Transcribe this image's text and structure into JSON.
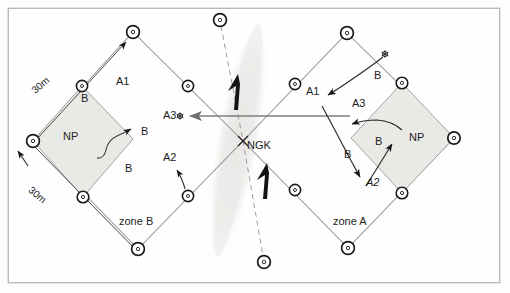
{
  "figure": {
    "center_label": "NGK",
    "zone_left_label": "zone B",
    "zone_right_label": "zone A",
    "np_left_label": "NP",
    "np_right_label": "NP",
    "dimension_upper": "30m",
    "dimension_lower": "30m"
  },
  "colors": {
    "node_ring": "#1a1a1a",
    "node_fill": "#ffffff",
    "edge": "#8d8d8d",
    "shade": "#e9e9e6",
    "band": "#eeeeec",
    "arrow_dark": "#161616",
    "arrow_gray": "#7e7e7e",
    "frame": "#b9b9b9",
    "text": "#1d1d1d",
    "background": "#fdfdfc"
  },
  "left_zone": {
    "name": "zone B",
    "routes": [
      {
        "id": "A1",
        "label": "A1",
        "x": 118,
        "y": 82
      },
      {
        "id": "A2",
        "label": "A2",
        "x": 170,
        "y": 158
      },
      {
        "id": "A3",
        "label": "A3",
        "x": 170,
        "y": 114
      }
    ],
    "ball_labels": [
      {
        "label": "B",
        "x": 85,
        "y": 98
      },
      {
        "label": "B",
        "x": 143,
        "y": 132
      },
      {
        "label": "B",
        "x": 127,
        "y": 168
      }
    ],
    "np_label": "NP",
    "zone_label": "zone B",
    "dim_top": "30m",
    "dim_bottom": "30m"
  },
  "right_zone": {
    "name": "zone A",
    "routes": [
      {
        "id": "A1",
        "label": "A1",
        "x": 310,
        "y": 92
      },
      {
        "id": "A2",
        "label": "A2",
        "x": 369,
        "y": 182
      },
      {
        "id": "A3",
        "label": "A3",
        "x": 356,
        "y": 104
      }
    ],
    "ball_labels": [
      {
        "label": "B",
        "x": 375,
        "y": 76
      },
      {
        "label": "B",
        "x": 398,
        "y": 141
      },
      {
        "label": "B",
        "x": 345,
        "y": 155
      }
    ],
    "np_label": "NP",
    "zone_label": "zone A"
  },
  "markers": {
    "center": "NGK",
    "asterisk_left": "A3-target-marker",
    "asterisk_right": "serve-marker"
  },
  "nodes": [
    {
      "name": "left-top-vertex",
      "x": 133,
      "y": 32
    },
    {
      "name": "left-upper-left-mid",
      "x": 82,
      "y": 86
    },
    {
      "name": "left-west-vertex",
      "x": 33,
      "y": 141
    },
    {
      "name": "left-lower-left-mid",
      "x": 83,
      "y": 197
    },
    {
      "name": "left-bottom-vertex",
      "x": 138,
      "y": 249
    },
    {
      "name": "left-lower-right-mid",
      "x": 188,
      "y": 196
    },
    {
      "name": "left-upper-right-mid",
      "x": 188,
      "y": 86
    },
    {
      "name": "right-top-vertex",
      "x": 347,
      "y": 33
    },
    {
      "name": "right-upper-left-mid",
      "x": 295,
      "y": 84
    },
    {
      "name": "right-upper-right-mid",
      "x": 402,
      "y": 83
    },
    {
      "name": "right-east-vertex",
      "x": 454,
      "y": 138
    },
    {
      "name": "right-lower-right-mid",
      "x": 402,
      "y": 193
    },
    {
      "name": "right-bottom-vertex",
      "x": 348,
      "y": 248
    },
    {
      "name": "right-lower-left-mid",
      "x": 295,
      "y": 190
    },
    {
      "name": "band-top-node",
      "x": 220,
      "y": 20
    },
    {
      "name": "band-bottom-node",
      "x": 264,
      "y": 262
    }
  ]
}
